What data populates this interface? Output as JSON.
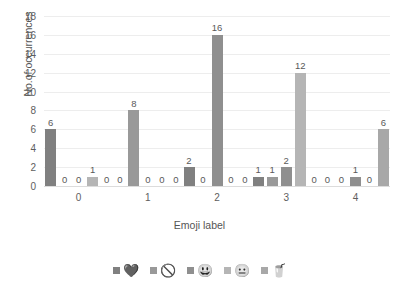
{
  "chart_data": {
    "type": "bar",
    "title": "",
    "xlabel": "Emoji label",
    "ylabel": "No.of occurrences",
    "categories": [
      "0",
      "1",
      "2",
      "3",
      "4"
    ],
    "ylim": [
      0,
      18
    ],
    "yticks": [
      0,
      2,
      4,
      6,
      8,
      10,
      12,
      14,
      16,
      18
    ],
    "grid": true,
    "legend_position": "bottom",
    "show_data_labels": true,
    "series": [
      {
        "name": "heart",
        "glyph": "💜",
        "color": "#808080",
        "values": [
          6,
          0,
          2,
          1,
          0
        ]
      },
      {
        "name": "prohibited",
        "glyph": "🚫",
        "color": "#999999",
        "values": [
          0,
          8,
          0,
          1,
          0
        ]
      },
      {
        "name": "grinning-face",
        "glyph": "😃",
        "color": "#8f8f8f",
        "values": [
          0,
          0,
          16,
          2,
          1
        ]
      },
      {
        "name": "neutral-face",
        "glyph": "😐",
        "color": "#b5b5b5",
        "values": [
          1,
          0,
          0,
          12,
          0
        ]
      },
      {
        "name": "cup",
        "glyph": "🥤",
        "color": "#a8a8a8",
        "values": [
          0,
          0,
          0,
          0,
          6
        ]
      }
    ]
  },
  "legend": [
    {
      "glyph": "💜",
      "color": "#808080"
    },
    {
      "glyph": "🚫",
      "color": "#999999"
    },
    {
      "glyph": "😃",
      "color": "#8f8f8f"
    },
    {
      "glyph": "😐",
      "color": "#b5b5b5"
    },
    {
      "glyph": "🥤",
      "color": "#a8a8a8"
    }
  ]
}
